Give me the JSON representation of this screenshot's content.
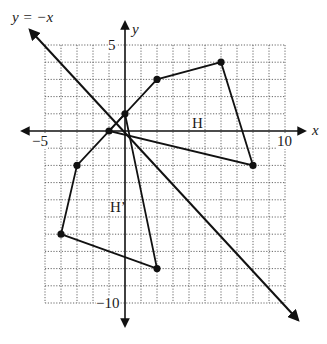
{
  "figure": {
    "type": "coordinate-plane-reflection",
    "line_label": "y = −x",
    "axis_labels": {
      "x": "x",
      "y": "y"
    },
    "tick_labels": {
      "x_min": "−5",
      "x_max": "10",
      "y_max": "5",
      "y_min": "−10"
    },
    "grid": {
      "x_range": [
        -5,
        10
      ],
      "y_range": [
        -10,
        5
      ],
      "step": 1
    },
    "shapes": [
      {
        "name": "H",
        "label": "H",
        "vertices": [
          [
            -1,
            0
          ],
          [
            2,
            3
          ],
          [
            6,
            4
          ],
          [
            8,
            -2
          ]
        ]
      },
      {
        "name": "H'",
        "label": "H’",
        "vertices": [
          [
            0,
            1
          ],
          [
            -3,
            -2
          ],
          [
            -4,
            -6
          ],
          [
            2,
            -8
          ]
        ]
      }
    ],
    "reflection_line": {
      "equation": "y = -x",
      "from": [
        -6,
        6
      ],
      "to": [
        10.5,
        -11.5
      ]
    }
  }
}
